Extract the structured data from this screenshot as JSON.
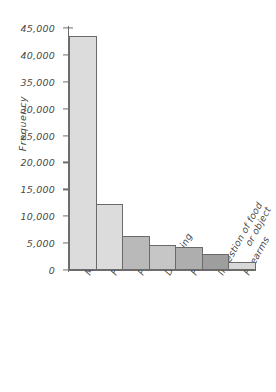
{
  "chart_data": {
    "type": "bar",
    "title": "",
    "subtitle": "",
    "xlabel": "",
    "ylabel": "Frequency",
    "categories": [
      "Motor vehicle",
      "Falls",
      "Poison",
      "Drowning",
      "Fire",
      "Ingestion of food\nor object",
      "Firearms"
    ],
    "values": [
      43500,
      12300,
      6400,
      4600,
      4200,
      2900,
      1500
    ],
    "ylim": [
      0,
      45000
    ],
    "y_ticks": [
      0,
      5000,
      10000,
      15000,
      20000,
      25000,
      30000,
      35000,
      40000,
      45000
    ],
    "y_tick_labels": [
      "0",
      "5,000",
      "10,000",
      "15,000",
      "20,000",
      "25,000",
      "30,000",
      "35,000",
      "40,000",
      "45,000"
    ],
    "grid": false,
    "legend": null,
    "bars_adjacent": true,
    "bar_colors": [
      "#dcdcdc",
      "#dcdcdc",
      "#b9b9b9",
      "#c6c6c6",
      "#aeaeae",
      "#9e9e9e",
      "#d8d8d8"
    ],
    "bar_outline_color": "#6a6a6a",
    "axis_color": "#6d6d6d",
    "text_color": "#4a4a4a",
    "background_color": "#ffffff"
  },
  "axes": {
    "y_title": "Frequency"
  }
}
